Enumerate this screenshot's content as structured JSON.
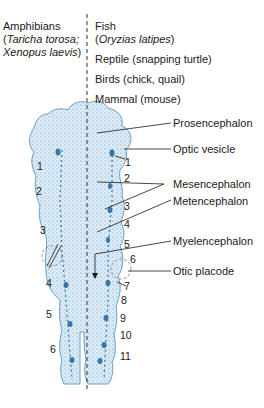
{
  "header": {
    "left_group": {
      "line1": "Amphibians",
      "line2_open": "(",
      "line2_italic": "Taricha torosa;",
      "line3_italic": "Xenopus laevis",
      "line3_close": ")"
    },
    "right_groups": [
      {
        "id": "fish",
        "line1": "Fish",
        "line2_open": "(",
        "line2_italic": "Oryzias latipes",
        "line2_close": ")"
      },
      {
        "id": "reptile",
        "label": "Reptile (snapping turtle)"
      },
      {
        "id": "birds",
        "label": "Birds (chick, quail)"
      },
      {
        "id": "mammal",
        "label": "Mammal (mouse)"
      }
    ]
  },
  "labels": [
    {
      "id": "prosencephalon",
      "text": "Prosencephalon"
    },
    {
      "id": "optic-vesicle",
      "text": "Optic vesicle"
    },
    {
      "id": "mesencephalon",
      "text": "Mesencephalon"
    },
    {
      "id": "metencephalon",
      "text": "Metencephalon"
    },
    {
      "id": "myelencephalon",
      "text": "Myelencephalon"
    },
    {
      "id": "otic-placode",
      "text": "Otic placode"
    }
  ],
  "left_numbers": [
    "1",
    "2",
    "3",
    "4",
    "5",
    "6"
  ],
  "right_numbers": [
    "1",
    "2",
    "3",
    "4",
    "5",
    "6",
    "7",
    "8",
    "9",
    "10",
    "11"
  ],
  "colors": {
    "embryo_fill": "#d6e8f3",
    "embryo_stroke": "#6a9fc6",
    "stipple": "#3f86bf",
    "line": "#1a1a1a"
  }
}
